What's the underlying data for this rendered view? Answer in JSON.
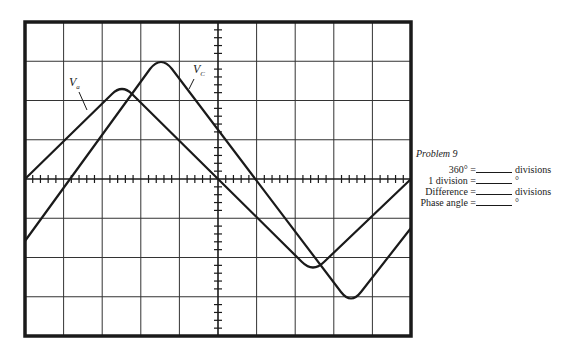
{
  "figure": {
    "grid": {
      "x_divisions": 10,
      "y_divisions": 8,
      "minor_ticks_per_division": 5
    },
    "labels": {
      "va": "V",
      "va_sub": "a",
      "vc": "V",
      "vc_sub": "C"
    },
    "colors": {
      "trace": "#1a1a1a",
      "grid": "#333333",
      "background": "#ffffff"
    }
  },
  "chart_data": {
    "type": "line",
    "title": "",
    "xlabel": "divisions",
    "ylabel": "divisions",
    "xlim": [
      -5,
      5
    ],
    "ylim": [
      -4,
      4
    ],
    "grid": true,
    "series": [
      {
        "name": "V_a",
        "x": [
          -5,
          -2.5,
          0,
          2.5,
          5
        ],
        "y": [
          0,
          2.3,
          0,
          -2.3,
          0
        ]
      },
      {
        "name": "V_C",
        "x": [
          -5,
          -3.8,
          -1.5,
          1,
          3.5,
          5
        ],
        "y": [
          -1.5,
          0,
          3.0,
          0,
          -3.0,
          -1.2
        ]
      }
    ]
  },
  "problem": {
    "title": "Problem 9",
    "rows": [
      {
        "label": "360° =",
        "unit": "divisions"
      },
      {
        "label": "1 division =",
        "unit": "°"
      },
      {
        "label": "Difference =",
        "unit": "divisions"
      },
      {
        "label": "Phase angle =",
        "unit": "°"
      }
    ]
  }
}
